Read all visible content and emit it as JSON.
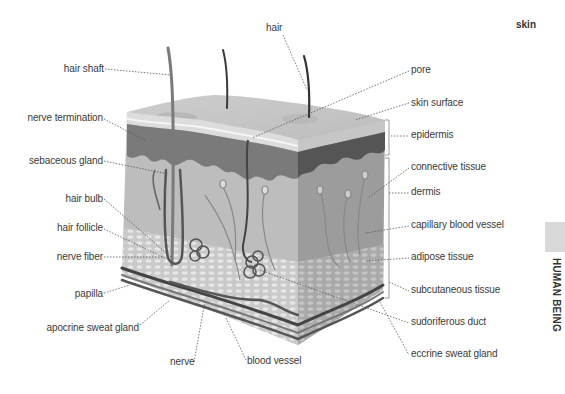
{
  "page": {
    "title": "skin",
    "section_tab": "HUMAN BEING"
  },
  "labels": {
    "left": [
      {
        "id": "hair-shaft",
        "text": "hair shaft"
      },
      {
        "id": "nerve-termination",
        "text": "nerve termination"
      },
      {
        "id": "sebaceous-gland",
        "text": "sebaceous gland"
      },
      {
        "id": "hair-bulb",
        "text": "hair bulb"
      },
      {
        "id": "hair-follicle",
        "text": "hair follicle"
      },
      {
        "id": "nerve-fiber",
        "text": "nerve fiber"
      },
      {
        "id": "papilla",
        "text": "papilla"
      },
      {
        "id": "apocrine-sweat-gland",
        "text": "apocrine sweat gland"
      }
    ],
    "top": [
      {
        "id": "hair",
        "text": "hair"
      }
    ],
    "bottom": [
      {
        "id": "nerve",
        "text": "nerve"
      },
      {
        "id": "blood-vessel",
        "text": "blood vessel"
      }
    ],
    "right": [
      {
        "id": "pore",
        "text": "pore"
      },
      {
        "id": "skin-surface",
        "text": "skin surface"
      },
      {
        "id": "epidermis",
        "text": "epidermis"
      },
      {
        "id": "connective-tissue",
        "text": "connective tissue"
      },
      {
        "id": "dermis",
        "text": "dermis"
      },
      {
        "id": "capillary-blood-vessel",
        "text": "capillary blood vessel"
      },
      {
        "id": "adipose-tissue",
        "text": "adipose tissue"
      },
      {
        "id": "subcutaneous-tissue",
        "text": "subcutaneous tissue"
      },
      {
        "id": "sudoriferous-duct",
        "text": "sudoriferous duct"
      },
      {
        "id": "eccrine-sweat-gland",
        "text": "eccrine sweat gland"
      }
    ]
  },
  "colors": {
    "top_surface": "#c8c8c8",
    "epidermis_light": "#dedede",
    "epidermis_dark": "#6e6e6e",
    "dermis_front": "#bdbdbd",
    "dermis_side": "#9c9c9c",
    "adipose": "#cfcfcf",
    "vessel": "#4a4a4a",
    "leader": "#555555",
    "text": "#3a3a3a"
  }
}
